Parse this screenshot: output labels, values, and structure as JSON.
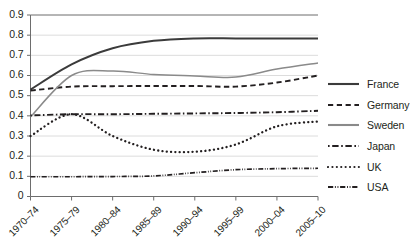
{
  "chart_data": {
    "type": "line",
    "title": "",
    "subtitle": "",
    "xlabel": "",
    "ylabel": "",
    "grid": true,
    "legend_position": "right",
    "ylim": [
      0,
      0.9
    ],
    "yticks": [
      "0",
      "0.1",
      "0.2",
      "0.3",
      "0.4",
      "0.5",
      "0.6",
      "0.7",
      "0.8",
      "0.9"
    ],
    "ytick_values": [
      0,
      0.1,
      0.2,
      0.3,
      0.4,
      0.5,
      0.6,
      0.7,
      0.8,
      0.9
    ],
    "categories": [
      "1970–74",
      "1975–79",
      "1980–84",
      "1985–89",
      "1990–94",
      "1995–99",
      "2000–04",
      "2005–10"
    ],
    "series": [
      {
        "name": "France",
        "style": "solid",
        "color": "#3b3b3b",
        "values": [
          0.53,
          0.655,
          0.735,
          0.772,
          0.784,
          0.784,
          0.783,
          0.783
        ]
      },
      {
        "name": "Germany",
        "style": "dashed",
        "color": "#231f20",
        "values": [
          0.525,
          0.545,
          0.547,
          0.548,
          0.548,
          0.545,
          0.565,
          0.6
        ]
      },
      {
        "name": "Sweden",
        "style": "solid-light",
        "color": "#8a8a8a",
        "values": [
          0.395,
          0.6,
          0.622,
          0.605,
          0.598,
          0.592,
          0.632,
          0.662
        ]
      },
      {
        "name": "Japan",
        "style": "dash-dot",
        "color": "#231f20",
        "values": [
          0.402,
          0.408,
          0.408,
          0.41,
          0.412,
          0.414,
          0.418,
          0.425
        ]
      },
      {
        "name": "UK",
        "style": "dotted",
        "color": "#231f20",
        "values": [
          0.3,
          0.408,
          0.3,
          0.232,
          0.222,
          0.258,
          0.348,
          0.372
        ]
      },
      {
        "name": "USA",
        "style": "dash-dot-dot",
        "color": "#231f20",
        "values": [
          0.098,
          0.098,
          0.099,
          0.102,
          0.118,
          0.133,
          0.138,
          0.14
        ]
      }
    ]
  },
  "legend": {
    "items": [
      {
        "label": "France"
      },
      {
        "label": "Germany"
      },
      {
        "label": "Sweden"
      },
      {
        "label": "Japan"
      },
      {
        "label": "UK"
      },
      {
        "label": "USA"
      }
    ]
  }
}
